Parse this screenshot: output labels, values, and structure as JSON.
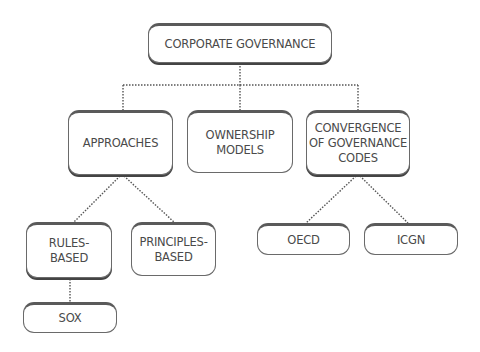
{
  "diagram": {
    "type": "org-tree",
    "root": {
      "id": "corporate-governance",
      "label": "CORPORATE GOVERNANCE"
    },
    "level1": [
      {
        "id": "approaches",
        "label": "APPROACHES"
      },
      {
        "id": "ownership-models",
        "label": "OWNERSHIP\nMODELS"
      },
      {
        "id": "convergence",
        "label": "CONVERGENCE\nOF GOVERNANCE\nCODES"
      }
    ],
    "level2": [
      {
        "id": "rules-based",
        "parent": "approaches",
        "label": "RULES-\nBASED"
      },
      {
        "id": "principles-based",
        "parent": "approaches",
        "label": "PRINCIPLES-\nBASED"
      },
      {
        "id": "oecd",
        "parent": "convergence",
        "label": "OECD"
      },
      {
        "id": "icgn",
        "parent": "convergence",
        "label": "ICGN"
      }
    ],
    "level3": [
      {
        "id": "sox",
        "parent": "rules-based",
        "label": "SOX"
      }
    ],
    "connector_style": "dotted",
    "colors": {
      "border": "#5a5a5a",
      "text": "#4a4a4a",
      "connector": "#555555",
      "background": "#ffffff"
    }
  }
}
